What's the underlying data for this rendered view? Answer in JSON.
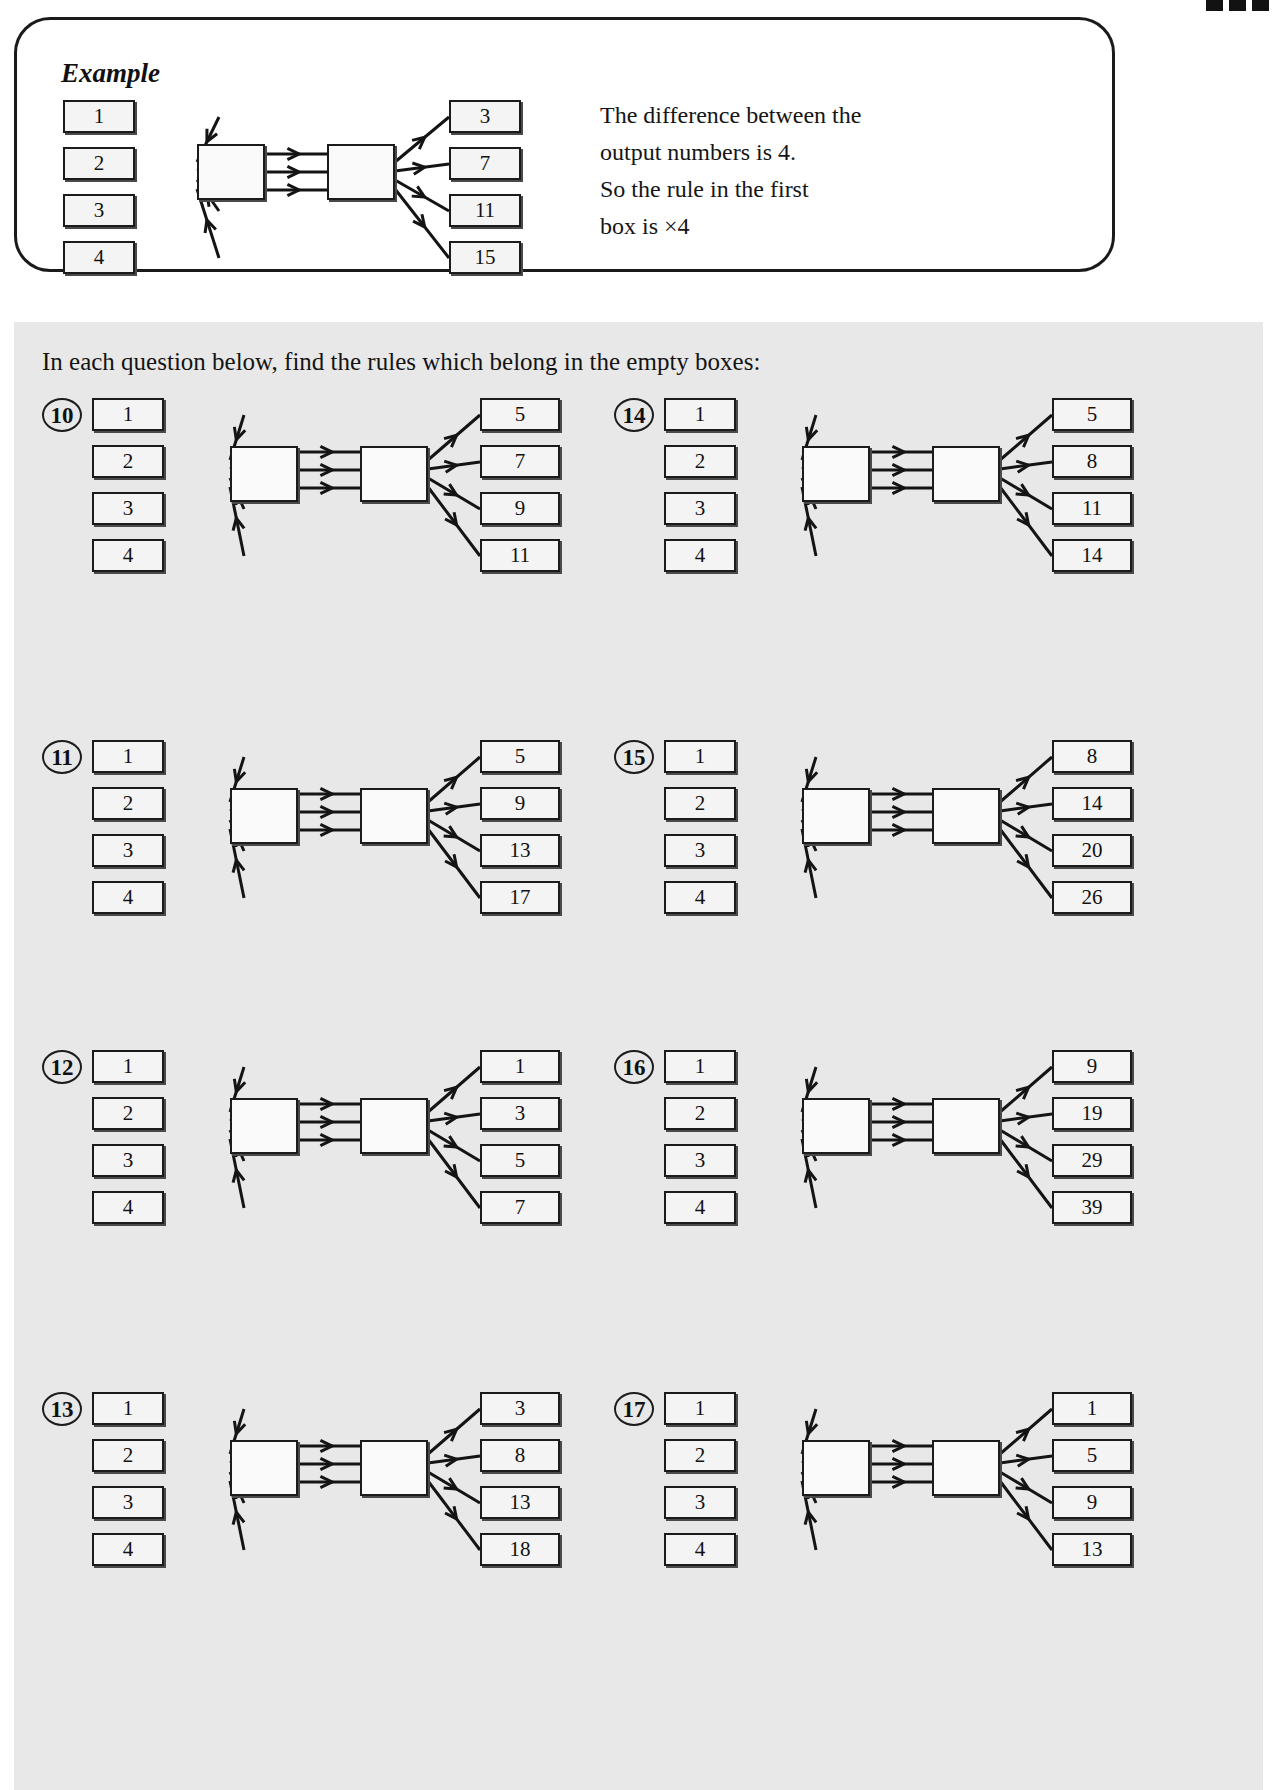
{
  "page": {
    "top_marks_count": 3
  },
  "example": {
    "title": "Example",
    "inputs": [
      "1",
      "2",
      "3",
      "4"
    ],
    "outputs": [
      "3",
      "7",
      "11",
      "15"
    ],
    "note_lines": [
      "The difference between the",
      "output numbers is 4.",
      "So the rule in the first",
      "box is ×4"
    ]
  },
  "worksheet": {
    "instruction": "In each question below, find the rules which belong in the empty boxes:",
    "questions": [
      {
        "number": "10",
        "inputs": [
          "1",
          "2",
          "3",
          "4"
        ],
        "outputs": [
          "5",
          "7",
          "9",
          "11"
        ]
      },
      {
        "number": "11",
        "inputs": [
          "1",
          "2",
          "3",
          "4"
        ],
        "outputs": [
          "5",
          "9",
          "13",
          "17"
        ]
      },
      {
        "number": "12",
        "inputs": [
          "1",
          "2",
          "3",
          "4"
        ],
        "outputs": [
          "1",
          "3",
          "5",
          "7"
        ]
      },
      {
        "number": "13",
        "inputs": [
          "1",
          "2",
          "3",
          "4"
        ],
        "outputs": [
          "3",
          "8",
          "13",
          "18"
        ]
      },
      {
        "number": "14",
        "inputs": [
          "1",
          "2",
          "3",
          "4"
        ],
        "outputs": [
          "5",
          "8",
          "11",
          "14"
        ]
      },
      {
        "number": "15",
        "inputs": [
          "1",
          "2",
          "3",
          "4"
        ],
        "outputs": [
          "8",
          "14",
          "20",
          "26"
        ]
      },
      {
        "number": "16",
        "inputs": [
          "1",
          "2",
          "3",
          "4"
        ],
        "outputs": [
          "9",
          "19",
          "29",
          "39"
        ]
      },
      {
        "number": "17",
        "inputs": [
          "1",
          "2",
          "3",
          "4"
        ],
        "outputs": [
          "1",
          "5",
          "9",
          "13"
        ]
      }
    ]
  },
  "colors": {
    "ink": "#121212",
    "sheet_background": "#e8e8e8",
    "box_fill": "#f4f4f4",
    "panel_background": "#ffffff"
  }
}
